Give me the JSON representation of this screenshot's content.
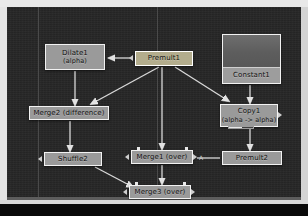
{
  "app": {
    "name": "node-graph-editor",
    "canvas_background": "#262626",
    "frame_color": "#e9e9e9"
  },
  "theme": {
    "node_fill": "#9a9a9a",
    "node_selected_fill": "#b3ad8d",
    "node_border": "#f2f2f2",
    "wire_color": "#d9d9d9",
    "grid_line": "#4a4a4a",
    "text_color": "#111111"
  },
  "graph": {
    "nodes": [
      {
        "id": "dilate1",
        "title": "Dilate1",
        "subtitle": "(alpha)",
        "selected": false,
        "x": 38,
        "y": 37,
        "w": 60,
        "h": 26
      },
      {
        "id": "premult1",
        "title": "Premult1",
        "subtitle": "",
        "selected": true,
        "x": 128,
        "y": 44,
        "w": 58,
        "h": 15
      },
      {
        "id": "constant1",
        "title": "Constant1",
        "subtitle": "",
        "selected": false,
        "x": 215,
        "y": 27,
        "w": 59,
        "h": 50
      },
      {
        "id": "merge2",
        "title": "Merge2 (difference)",
        "subtitle": "",
        "selected": false,
        "x": 22,
        "y": 99,
        "w": 80,
        "h": 14
      },
      {
        "id": "copy1",
        "title": "Copy1",
        "subtitle": "(alpha -> alpha)",
        "selected": false,
        "x": 213,
        "y": 97,
        "w": 58,
        "h": 23
      },
      {
        "id": "shuffle2",
        "title": "Shuffle2",
        "subtitle": "",
        "selected": false,
        "x": 37,
        "y": 145,
        "w": 58,
        "h": 14
      },
      {
        "id": "merge1",
        "title": "Merge1 (over)",
        "subtitle": "",
        "selected": false,
        "x": 124,
        "y": 143,
        "w": 62,
        "h": 14
      },
      {
        "id": "premult2",
        "title": "Premult2",
        "subtitle": "",
        "selected": false,
        "x": 215,
        "y": 144,
        "w": 60,
        "h": 14
      },
      {
        "id": "merge3",
        "title": "Merge3 (over)",
        "subtitle": "",
        "selected": false,
        "x": 122,
        "y": 178,
        "w": 62,
        "h": 14
      }
    ],
    "connections": [
      {
        "from": "premult1",
        "to": "dilate1",
        "label": ""
      },
      {
        "from": "dilate1",
        "to": "merge2",
        "label": ""
      },
      {
        "from": "premult1",
        "to": "merge2",
        "label": ""
      },
      {
        "from": "premult1",
        "to": "copy1",
        "label": ""
      },
      {
        "from": "premult1",
        "to": "merge1",
        "label": ""
      },
      {
        "from": "constant1",
        "to": "copy1",
        "label": ""
      },
      {
        "from": "copy1",
        "to": "premult2",
        "label": ""
      },
      {
        "from": "premult2",
        "to": "merge1",
        "label": "A"
      },
      {
        "from": "merge2",
        "to": "shuffle2",
        "label": ""
      },
      {
        "from": "shuffle2",
        "to": "merge3",
        "label": ""
      },
      {
        "from": "merge1",
        "to": "merge3",
        "label": ""
      }
    ],
    "port_labels": {
      "merge1_a": "A"
    },
    "grid_lines_x": [
      31,
      150
    ]
  }
}
